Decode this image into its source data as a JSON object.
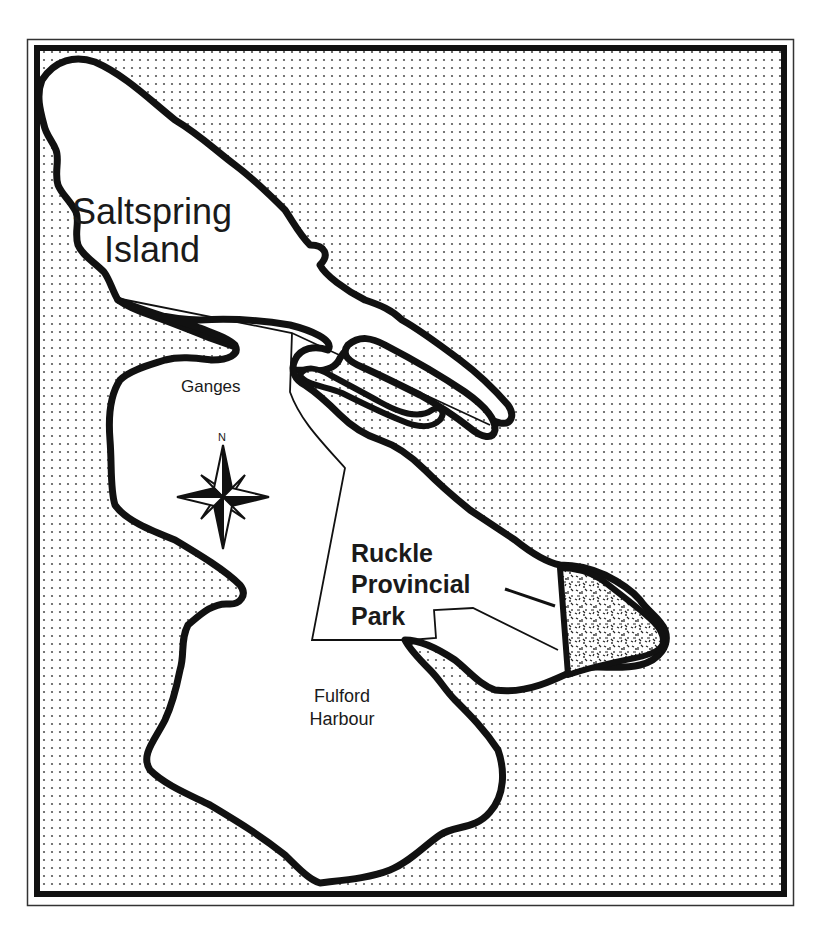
{
  "map": {
    "title": "Saltspring Island",
    "labels": {
      "island_line1": "Saltspring",
      "island_line2": "Island",
      "ganges": "Ganges",
      "park_line1": "Ruckle",
      "park_line2": "Provincial",
      "park_line3": "Park",
      "fulford_line1": "Fulford",
      "fulford_line2": "Harbour",
      "north": "N"
    },
    "features": {
      "water_pattern": "dotted",
      "park_fill": "stippled",
      "compass_rose": "eight-point"
    },
    "colors": {
      "land": "#ffffff",
      "coastline": "#111111",
      "water_dots": "#555555",
      "frame": "#111111"
    }
  }
}
